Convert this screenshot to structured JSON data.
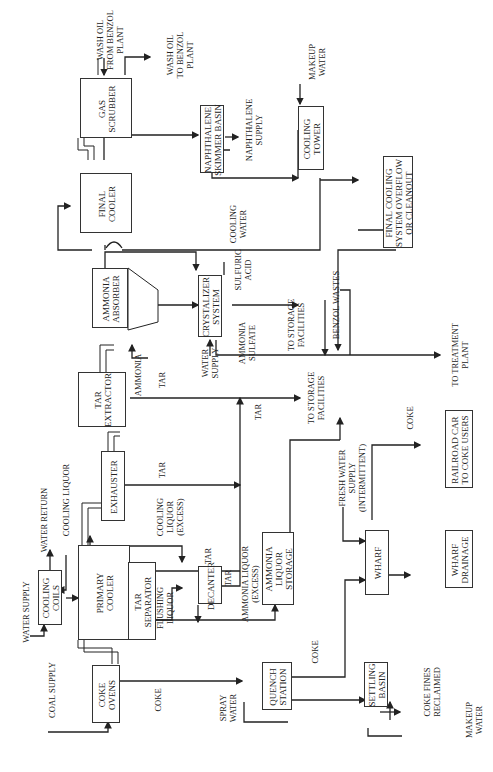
{
  "diagram": {
    "orientation": "rotated-90-ccw",
    "units": [
      {
        "id": "coke-ovens",
        "label": "COKE\nOVENS"
      },
      {
        "id": "cooling-coils",
        "label": "COOLING\nCOILS"
      },
      {
        "id": "primary-cooler",
        "label": "PRIMARY\nCOOLER"
      },
      {
        "id": "tar-separator",
        "label": "TAR\nSEPARATOR"
      },
      {
        "id": "decanter",
        "label": "DECANTER"
      },
      {
        "id": "ammonia-liquor-storage",
        "label": "AMMONIA\nLIQUOR\nSTORAGE"
      },
      {
        "id": "quench-station",
        "label": "QUENCH\nSTATION"
      },
      {
        "id": "settling-basin",
        "label": "SETTLING\nBASIN"
      },
      {
        "id": "wharf",
        "label": "WHARF"
      },
      {
        "id": "wharf-drainage",
        "label": "WHARF\nDRAINAGE"
      },
      {
        "id": "railroad-car",
        "label": "RAILROAD CAR\nTO COKE USERS"
      },
      {
        "id": "exhauster",
        "label": "EXHAUSTER"
      },
      {
        "id": "tar-extractor",
        "label": "TAR\nEXTRACTOR"
      },
      {
        "id": "ammonia-absorber",
        "label": "AMMONIA\nABSORBER"
      },
      {
        "id": "crystalizer-system",
        "label": "CRYSTALIZER\nSYSTEM"
      },
      {
        "id": "final-cooler",
        "label": "FINAL\nCOOLER"
      },
      {
        "id": "gas-scrubber",
        "label": "GAS\nSCRUBBER"
      },
      {
        "id": "naphthalene-skimmer",
        "label": "NAPHTHALENE\nSKIMMER BASIN"
      },
      {
        "id": "cooling-tower",
        "label": "COOLING\nTOWER"
      },
      {
        "id": "final-cooling-overflow",
        "label": "FINAL COOLING\nSYSTEM OVERFLOW\nOR CLEANOUT"
      }
    ],
    "streams": {
      "water_supply": "WATER SUPPLY",
      "coal_supply": "COAL SUPPLY",
      "coke_1": "COKE",
      "water_return": "WATER RETURN",
      "cooling_liquor": "COOLING LIQUOR",
      "flushing_liquor": "FLUSHING\nLIQUOR",
      "cooling_liquor_excess": "COOLING\nLIQUOR\n(EXCESS)",
      "tar_1": "TAR",
      "tar_2": "TAR",
      "tar_3": "TAR",
      "tar_4": "TAR",
      "tar_5": "TAR",
      "ammonia_liquor_excess": "AMMONIA LIQUOR\n(EXCESS)",
      "coke_2": "COKE",
      "spray_water": "SPRAY\nWATER",
      "coke_fines": "COKE FINES\nRECLAIMED",
      "makeup_water_1": "MAKEUP\nWATER",
      "fresh_water": "FRESH WATER\nSUPPLY\n(INTERMITTENT)",
      "coke_3": "COKE",
      "to_storage_1": "TO STORAGE\nFACILITIES",
      "ammonia": "AMMONIA",
      "water_supply_2": "WATER\nSUPPLY",
      "ammonia_sulfate": "AMMONIA\nSULFATE",
      "to_storage_2": "TO STORAGE\nFACILITIES",
      "sulfuric_acid": "SULFURIC\nACID",
      "benzol_wastes": "BENZOL WASTES",
      "to_treatment": "TO TREATMENT\nPLANT",
      "cooling_water": "COOLING\nWATER",
      "naphthalene_supply": "NAPHTHALENE\nSUPPLY",
      "makeup_water_2": "MAKEUP\nWATER",
      "wash_oil_from": "WASH OIL\nFROM BENZOL\nPLANT",
      "wash_oil_to": "WASH OIL\nTO BENZOL\nPLANT"
    }
  }
}
